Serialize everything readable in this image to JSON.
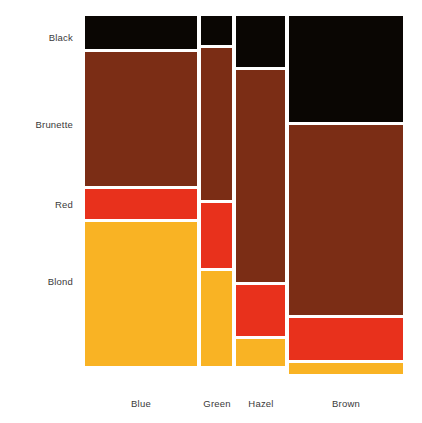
{
  "chart_data": {
    "type": "mosaic",
    "title": "",
    "subtitle": "",
    "xlabel": "",
    "ylabel": "",
    "grid": false,
    "legend": "none",
    "x_categories": [
      "Blue",
      "Green",
      "Hazel",
      "Brown"
    ],
    "y_categories": [
      "Black",
      "Brunette",
      "Red",
      "Blond"
    ],
    "x_category_label": "Eye",
    "y_category_label": "Hair",
    "x_widths_pct": [
      32.9,
      10.6,
      14.4,
      42.1
    ],
    "counts": {
      "Blue": {
        "Black": 20,
        "Brunette": 84,
        "Red": 17,
        "Blond": 94
      },
      "Green": {
        "Black": 5,
        "Brunette": 29,
        "Red": 14,
        "Blond": 16
      },
      "Hazel": {
        "Black": 15,
        "Brunette": 54,
        "Red": 14,
        "Blond": 10
      },
      "Brown": {
        "Black": 68,
        "Brunette": 119,
        "Red": 26,
        "Blond": 7
      }
    },
    "column_totals": {
      "Blue": 215,
      "Green": 64,
      "Hazel": 93,
      "Brown": 220
    },
    "grand_total": 592,
    "series": [
      {
        "name": "Black",
        "color": "#0a0603",
        "values": [
          20,
          5,
          15,
          68
        ]
      },
      {
        "name": "Brunette",
        "color": "#7b2d15",
        "values": [
          84,
          29,
          54,
          119
        ]
      },
      {
        "name": "Red",
        "color": "#e8311c",
        "values": [
          17,
          14,
          14,
          26
        ]
      },
      {
        "name": "Blond",
        "color": "#f9b324",
        "values": [
          94,
          16,
          10,
          7
        ]
      }
    ],
    "tiles": [
      {
        "col": "Blue",
        "row": "Black",
        "x": 85,
        "y": 16,
        "w": 112,
        "h": 33,
        "color": "#0a0603"
      },
      {
        "col": "Blue",
        "row": "Brunette",
        "x": 85,
        "y": 52,
        "w": 112,
        "h": 134,
        "color": "#7b2d15"
      },
      {
        "col": "Blue",
        "row": "Red",
        "x": 85,
        "y": 189,
        "w": 112,
        "h": 30,
        "color": "#e8311c"
      },
      {
        "col": "Blue",
        "row": "Blond",
        "x": 85,
        "y": 222,
        "w": 112,
        "h": 144,
        "color": "#f9b324"
      },
      {
        "col": "Green",
        "row": "Black",
        "x": 201,
        "y": 16,
        "w": 31,
        "h": 29,
        "color": "#0a0603"
      },
      {
        "col": "Green",
        "row": "Brunette",
        "x": 201,
        "y": 48,
        "w": 31,
        "h": 152,
        "color": "#7b2d15"
      },
      {
        "col": "Green",
        "row": "Red",
        "x": 201,
        "y": 203,
        "w": 31,
        "h": 65,
        "color": "#e8311c"
      },
      {
        "col": "Green",
        "row": "Blond",
        "x": 201,
        "y": 271,
        "w": 31,
        "h": 95,
        "color": "#f9b324"
      },
      {
        "col": "Hazel",
        "row": "Black",
        "x": 236,
        "y": 16,
        "w": 49,
        "h": 51,
        "color": "#0a0603"
      },
      {
        "col": "Hazel",
        "row": "Brunette",
        "x": 236,
        "y": 70,
        "w": 49,
        "h": 212,
        "color": "#7b2d15"
      },
      {
        "col": "Hazel",
        "row": "Red",
        "x": 236,
        "y": 285,
        "w": 49,
        "h": 51,
        "color": "#e8311c"
      },
      {
        "col": "Hazel",
        "row": "Blond",
        "x": 236,
        "y": 339,
        "w": 49,
        "h": 27,
        "color": "#f9b324"
      },
      {
        "col": "Brown",
        "row": "Black",
        "x": 289,
        "y": 16,
        "w": 114,
        "h": 106,
        "color": "#0a0603"
      },
      {
        "col": "Brown",
        "row": "Brunette",
        "x": 289,
        "y": 125,
        "w": 114,
        "h": 190,
        "color": "#7b2d15"
      },
      {
        "col": "Brown",
        "row": "Red",
        "x": 289,
        "y": 318,
        "w": 114,
        "h": 42,
        "color": "#e8311c"
      },
      {
        "col": "Brown",
        "row": "Blond",
        "x": 289,
        "y": 363,
        "w": 114,
        "h": 11,
        "color": "#f9b324"
      }
    ],
    "row_label_positions": [
      {
        "label": "Black",
        "y": 37
      },
      {
        "label": "Brunette",
        "y": 124
      },
      {
        "label": "Red",
        "y": 204
      },
      {
        "label": "Blond",
        "y": 281
      }
    ],
    "col_label_positions": [
      {
        "label": "Blue",
        "x": 141
      },
      {
        "label": "Green",
        "x": 217
      },
      {
        "label": "Hazel",
        "x": 261
      },
      {
        "label": "Brown",
        "x": 346
      }
    ]
  },
  "colors": {
    "background": "#ffffff",
    "text": "#3a3a3a",
    "black_hair": "#0a0603",
    "brunette_hair": "#7b2d15",
    "red_hair": "#e8311c",
    "blond_hair": "#f9b324"
  },
  "labels": {
    "row_label_right_edge": 73,
    "col_label_baseline_y": 398
  }
}
